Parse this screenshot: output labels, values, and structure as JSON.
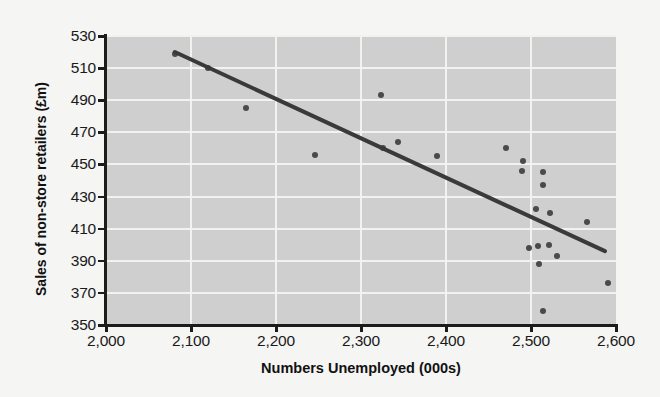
{
  "chart_data": {
    "type": "scatter",
    "title": "",
    "xlabel": "Numbers Unemployed (000s)",
    "ylabel": "Sales of non-store retailers (£m)",
    "xlim": [
      2000,
      2600
    ],
    "ylim": [
      350,
      530
    ],
    "xticks": [
      2000,
      2100,
      2200,
      2300,
      2400,
      2500,
      2600
    ],
    "xticklabels": [
      "2,000",
      "2,100",
      "2,200",
      "2,300",
      "2,400",
      "2,500",
      "2,600"
    ],
    "yticks": [
      350,
      370,
      390,
      410,
      430,
      450,
      470,
      490,
      510,
      530
    ],
    "yticklabels": [
      "350",
      "370",
      "390",
      "410",
      "430",
      "450",
      "470",
      "490",
      "510",
      "530"
    ],
    "grid": true,
    "grid_color": "#f2f2f0",
    "plot_bgcolor": "#cfcfcf",
    "figure_bgcolor": "#f5f5f3",
    "marker_color": "#4a4a4a",
    "trendline_color": "#3a3a3a",
    "legend": null,
    "points": [
      {
        "x": 2081,
        "y": 519
      },
      {
        "x": 2120,
        "y": 510
      },
      {
        "x": 2165,
        "y": 485
      },
      {
        "x": 2246,
        "y": 456
      },
      {
        "x": 2324,
        "y": 493
      },
      {
        "x": 2326,
        "y": 460
      },
      {
        "x": 2344,
        "y": 464
      },
      {
        "x": 2389,
        "y": 455
      },
      {
        "x": 2470,
        "y": 460
      },
      {
        "x": 2491,
        "y": 452
      },
      {
        "x": 2489,
        "y": 446
      },
      {
        "x": 2514,
        "y": 445
      },
      {
        "x": 2514,
        "y": 437
      },
      {
        "x": 2506,
        "y": 422
      },
      {
        "x": 2522,
        "y": 420
      },
      {
        "x": 2566,
        "y": 414
      },
      {
        "x": 2498,
        "y": 398
      },
      {
        "x": 2508,
        "y": 399
      },
      {
        "x": 2521,
        "y": 400
      },
      {
        "x": 2530,
        "y": 393
      },
      {
        "x": 2509,
        "y": 388
      },
      {
        "x": 2591,
        "y": 376
      },
      {
        "x": 2514,
        "y": 359
      }
    ],
    "trendline": {
      "x_start": 2081,
      "y_start": 520,
      "x_end": 2587,
      "y_end": 396
    }
  }
}
